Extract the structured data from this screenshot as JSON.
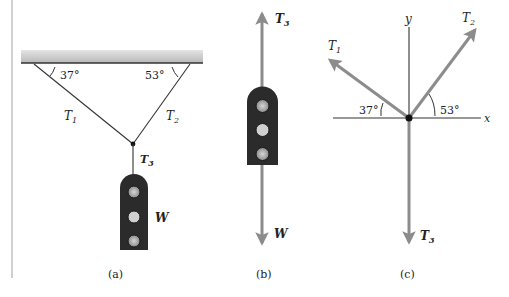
{
  "figure": {
    "panels": [
      {
        "id": "a",
        "caption": "(a)",
        "labels": {
          "t1": "T",
          "t1_sub": "1",
          "t2": "T",
          "t2_sub": "2",
          "t3": "T",
          "t3_sub": "3",
          "weight": "W",
          "angle_left": "37°",
          "angle_right": "53°"
        }
      },
      {
        "id": "b",
        "caption": "(b)",
        "labels": {
          "t3": "T",
          "t3_sub": "3",
          "weight": "W"
        }
      },
      {
        "id": "c",
        "caption": "(c)",
        "labels": {
          "t1": "T",
          "t1_sub": "1",
          "t2": "T",
          "t2_sub": "2",
          "t3": "T",
          "t3_sub": "3",
          "x_axis": "x",
          "y_axis": "y",
          "angle_left": "37°",
          "angle_right": "53°"
        }
      }
    ],
    "colors": {
      "line": "#333333",
      "vector": "#8c8c8c",
      "weight_body": "#2b2b2b",
      "weight_hole": "#9a9a9a",
      "ceiling": "#c4c4c4",
      "border": "#b0b0b0"
    }
  }
}
